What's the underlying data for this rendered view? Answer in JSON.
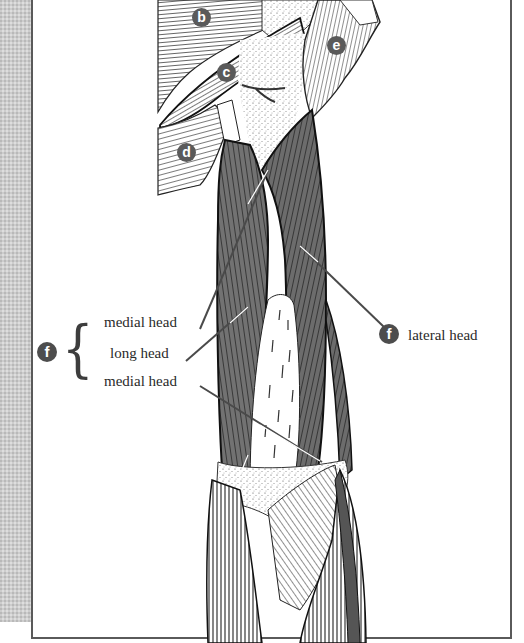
{
  "figure": {
    "colors": {
      "background": "#ffffff",
      "side_strip": "#cdcdcd",
      "frame_border": "#5a5a5a",
      "muscle_fill": "#6e6e6e",
      "striation": "#1e1e1e",
      "badge_fill": "#4d4d4d",
      "badge_text": "#ffffff",
      "leader_line": "#4a4a4a",
      "label_text": "#2a2a2a"
    }
  },
  "badges": [
    {
      "id": "b",
      "letter": "b"
    },
    {
      "id": "c",
      "letter": "c"
    },
    {
      "id": "d",
      "letter": "d"
    },
    {
      "id": "e",
      "letter": "e"
    },
    {
      "id": "f_left",
      "letter": "f"
    },
    {
      "id": "f_right",
      "letter": "f"
    }
  ],
  "labels": {
    "group_brace": "{",
    "medial_head_upper": "medial head",
    "long_head": "long head",
    "medial_head_lower": "medial head",
    "lateral_head": "lateral head"
  }
}
